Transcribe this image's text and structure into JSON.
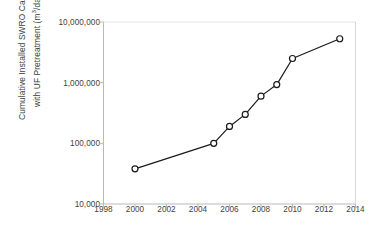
{
  "chart_data": {
    "type": "line",
    "title": "",
    "xlabel": "",
    "ylabel": "Cumulative Installed SWRO Capacity with UF Pretreatment (m3/day)",
    "ylabel_line1": "Cumulative Installed SWRO Capacity",
    "ylabel_line2_prefix": "with UF Pretreatment (m",
    "ylabel_line2_sup": "3",
    "ylabel_line2_suffix": "/day)",
    "yscale": "log",
    "ylim": [
      10000,
      10000000
    ],
    "xlim": [
      1998,
      2014
    ],
    "grid": false,
    "legend": null,
    "marker": "open-circle",
    "line_color": "#1a1a1a",
    "marker_face_color": "#ffffff",
    "x_tick_labels": [
      "1998",
      "2000",
      "2002",
      "2004",
      "2006",
      "2008",
      "2010",
      "2012",
      "2014"
    ],
    "x_tick_values": [
      1998,
      2000,
      2002,
      2004,
      2006,
      2008,
      2010,
      2012,
      2014
    ],
    "y_tick_labels": [
      "10,000",
      "100,000",
      "1,000,000",
      "10,000,000"
    ],
    "y_tick_values": [
      10000,
      100000,
      1000000,
      10000000
    ],
    "x": [
      2000,
      2005,
      2006,
      2007,
      2008,
      2009,
      2010,
      2013
    ],
    "values": [
      38000,
      100000,
      190000,
      300000,
      600000,
      930000,
      2500000,
      5300000
    ],
    "points": [
      {
        "x": 2000,
        "y": 38000
      },
      {
        "x": 2005,
        "y": 100000
      },
      {
        "x": 2006,
        "y": 190000
      },
      {
        "x": 2007,
        "y": 300000
      },
      {
        "x": 2008,
        "y": 600000
      },
      {
        "x": 2009,
        "y": 930000
      },
      {
        "x": 2010,
        "y": 2500000
      },
      {
        "x": 2013,
        "y": 5300000
      }
    ]
  }
}
